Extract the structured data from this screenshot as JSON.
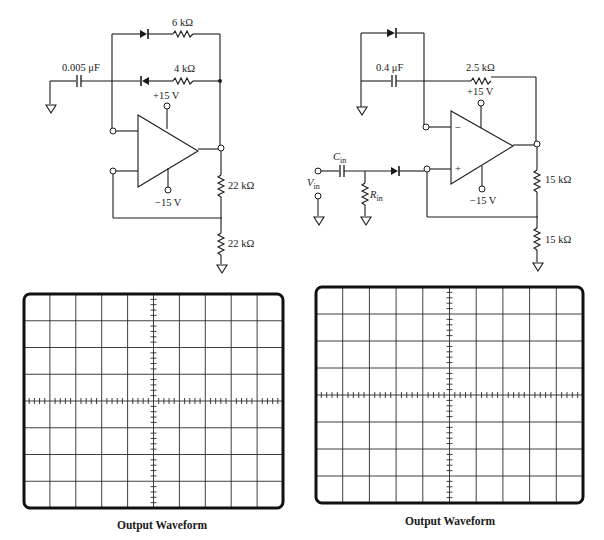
{
  "circuit_left": {
    "capacitor": "0.005 μF",
    "resistor_top": "6 kΩ",
    "resistor_mid": "4 kΩ",
    "supply_pos": "+15 V",
    "supply_neg": "−15 V",
    "divider_top": "22 kΩ",
    "divider_bottom": "22 kΩ"
  },
  "circuit_right": {
    "capacitor": "0.4 μF",
    "resistor_feedback": "2.5 kΩ",
    "supply_pos": "+15 V",
    "supply_neg": "−15 V",
    "inverting_sign": "−",
    "noninverting_sign": "+",
    "input_cap": "C",
    "input_cap_sub": "in",
    "input_res": "R",
    "input_res_sub": "in",
    "input_source": "V",
    "input_source_sub": "in",
    "divider_top": "15 kΩ",
    "divider_bottom": "15 kΩ"
  },
  "scope_left": {
    "caption": "Output Waveform",
    "h_divisions": 10,
    "v_divisions": 8
  },
  "scope_right": {
    "caption": "Output Waveform",
    "h_divisions": 10,
    "v_divisions": 8
  }
}
